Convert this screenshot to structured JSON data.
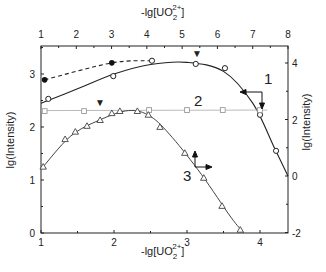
{
  "chart_data": {
    "type": "line",
    "title": "",
    "xlabel_bottom": "-lg[UO2 2+]",
    "xlabel_top": "-lg[UO2 2+]",
    "ylabel_left": "lg(Intensity)",
    "ylabel_right": "lg(Intensity)",
    "axes": {
      "bottom": {
        "range": [
          1,
          4.3
        ],
        "ticks": [
          "1",
          "2",
          "3",
          "4"
        ]
      },
      "top": {
        "range": [
          1,
          8
        ],
        "ticks": [
          "1",
          "2",
          "3",
          "4",
          "5",
          "6",
          "7",
          "8"
        ]
      },
      "left": {
        "range": [
          0,
          3.5
        ],
        "ticks": [
          "0",
          "1",
          "2",
          "3"
        ]
      },
      "right": {
        "range": [
          -2,
          4.5
        ],
        "ticks": [
          "-2",
          "0",
          "2",
          "4"
        ]
      }
    },
    "grid": false,
    "legend": "none (curves labelled inline 1, 2, 3 with axis-indicator arrows)",
    "series": [
      {
        "name": "1",
        "marker": "open-circle",
        "line": "solid",
        "axes": "bottom-left",
        "x": [
          1.1,
          1.99,
          2.52,
          3.12,
          3.52,
          4.0,
          4.22
        ],
        "y": [
          2.53,
          2.96,
          3.25,
          3.19,
          3.11,
          2.23,
          1.55
        ],
        "axis_hint": "top-right (arrows point left and down)"
      },
      {
        "name": "1 (filled)",
        "marker": "filled-circle",
        "line": "dashed",
        "axes": "bottom-left",
        "x": [
          1.05,
          1.97,
          2.52
        ],
        "y": [
          2.89,
          3.21,
          3.25
        ]
      },
      {
        "name": "2",
        "marker": "open-square",
        "line": "light solid",
        "axes": "bottom-left",
        "x": [
          1.05,
          1.59,
          2.48,
          3.0,
          3.49,
          4.0
        ],
        "y": [
          2.3,
          2.3,
          2.32,
          2.32,
          2.32,
          2.32
        ]
      },
      {
        "name": "3",
        "marker": "open-triangle",
        "line": "solid",
        "axes": "bottom-left",
        "x": [
          1.03,
          1.33,
          1.47,
          1.63,
          1.81,
          1.97,
          2.08,
          2.32,
          2.47,
          2.63,
          2.97,
          3.23,
          3.48,
          3.73
        ],
        "y": [
          1.25,
          1.77,
          1.91,
          2.02,
          2.13,
          2.26,
          2.3,
          2.3,
          2.23,
          2.0,
          1.51,
          1.04,
          0.51,
          0.06
        ],
        "axis_hint": "bottom-left (arrows point up and right)"
      }
    ],
    "annotations": [
      {
        "type": "peak-marker",
        "symbol": "▼",
        "series": "1",
        "x_top": 5.4
      },
      {
        "type": "peak-marker",
        "symbol": "▼",
        "series": "3",
        "x_bottom": 2.2
      },
      {
        "type": "label",
        "text": "1"
      },
      {
        "type": "label",
        "text": "2"
      },
      {
        "type": "label",
        "text": "3"
      }
    ]
  },
  "labels": {
    "axis_title_prefix": "-lg[UO",
    "axis_title_sub": "2",
    "axis_title_sup": "2+",
    "axis_title_suffix": "]",
    "ylabel": "lg(Intensity)",
    "curve1": "1",
    "curve2": "2",
    "curve3": "3",
    "peak_marker": "▼"
  }
}
